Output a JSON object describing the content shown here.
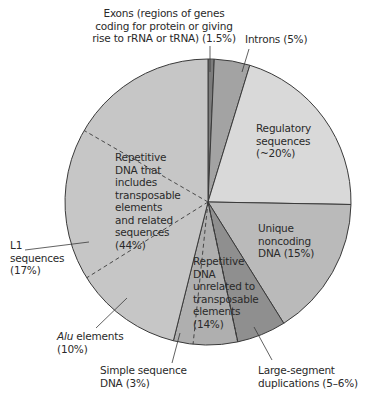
{
  "chart_data": {
    "type": "pie",
    "title": "",
    "center": [
      208,
      202
    ],
    "radius": 143,
    "slices": [
      {
        "name": "Exons (regions of genes coding for protein or giving rise to rRNA or tRNA)",
        "value": 1.5,
        "start_deg": 0,
        "end_deg": 2.5,
        "color": "#7c7c7c"
      },
      {
        "name": "Introns",
        "value": 5,
        "start_deg": 2.5,
        "end_deg": 17,
        "color": "#a3a3a3"
      },
      {
        "name": "Regulatory sequences",
        "value": 20,
        "approx": true,
        "start_deg": 17,
        "end_deg": 91,
        "color": "#d9d9d9"
      },
      {
        "name": "Unique noncoding DNA",
        "value": 15,
        "start_deg": 91,
        "end_deg": 148,
        "color": "#bababa"
      },
      {
        "name": "Large-segment duplications",
        "value": "5-6",
        "start_deg": 148,
        "end_deg": 168,
        "color": "#8f8f8f"
      },
      {
        "name": "Repetitive DNA unrelated to transposable elements",
        "value": 14,
        "start_deg": 168,
        "end_deg": 194,
        "color": "#afafaf"
      },
      {
        "name": "Repetitive DNA that includes transposable elements and related sequences",
        "value": 44,
        "start_deg": 194,
        "end_deg": 360,
        "color": "#c6c6c6"
      }
    ],
    "sub_segments": [
      {
        "name": "Simple sequence DNA",
        "value": 3,
        "parent": "Repetitive DNA unrelated to transposable elements"
      },
      {
        "name": "Large-segment duplications",
        "value": "5-6",
        "parent": "Repetitive DNA unrelated to transposable elements"
      },
      {
        "name": "Alu elements",
        "value": 10,
        "parent": "Repetitive DNA that includes transposable elements and related sequences"
      },
      {
        "name": "L1 sequences",
        "value": 17,
        "parent": "Repetitive DNA that includes transposable elements and related sequences"
      }
    ],
    "dashed_dividers_deg": [
      186,
      168,
      238,
      300
    ],
    "legend": "none (direct labels)"
  },
  "labels": {
    "exons": "Exons (regions of genes\ncoding for protein or giving\nrise to rRNA or tRNA) (1.5%)",
    "introns": "Introns (5%)",
    "regulatory": "Regulatory\nsequences\n(~20%)",
    "unique": "Unique\nnoncoding\nDNA (15%)",
    "repetitive_te": "Repetitive\nDNA that\nincludes\ntransposable\nelements\nand related\nsequences\n(44%)",
    "repetitive_unrelated": "Repetitive\nDNA\nunrelated to\ntransposable\nelements\n(14%)",
    "l1": "L1\nsequences\n(17%)",
    "alu_italic": "Alu",
    "alu_rest": " elements\n(10%)",
    "simple": "Simple sequence\nDNA (3%)",
    "large_segment": "Large-segment\nduplications (5–6%)"
  },
  "colors": {
    "outline": "#3a3a3a",
    "text": "#2a2a2a"
  }
}
